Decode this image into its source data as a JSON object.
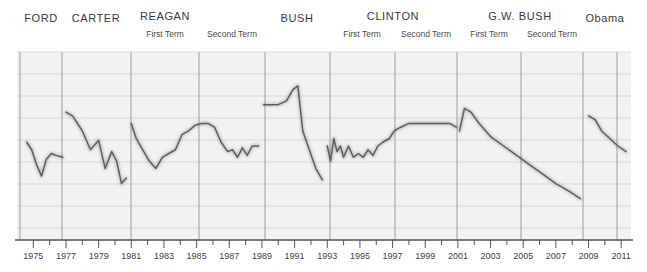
{
  "figure": {
    "background_color": "#ffffff",
    "plot_background_color": "#f2f2f2",
    "gridline_color": "#d8d8d8",
    "divider_color": "#808080",
    "series_color": "#5a5a5a",
    "axis_color": "#555555",
    "plot_left": 17,
    "plot_right": 631,
    "plot_top": 52,
    "plot_bottom": 240
  },
  "presidents": [
    {
      "name": "FORD",
      "terms": [],
      "label_x": 41,
      "start_x": 20,
      "end_x": 62
    },
    {
      "name": "CARTER",
      "terms": [],
      "label_x": 96,
      "start_x": 62,
      "end_x": 131
    },
    {
      "name": "REAGAN",
      "terms": [
        "First Term",
        "Second Term"
      ],
      "label_x": 165,
      "start_x": 131,
      "end_x": 199,
      "term_x": [
        165,
        232
      ],
      "term2_end_x": 265
    },
    {
      "name": "BUSH",
      "terms": [],
      "label_x": 297,
      "start_x": 265,
      "end_x": 330
    },
    {
      "name": "CLINTON",
      "terms": [
        "First Term",
        "Second Term"
      ],
      "label_x": 393,
      "start_x": 330,
      "end_x": 395,
      "term_x": [
        362,
        426
      ],
      "term2_end_x": 457
    },
    {
      "name": "G.W. BUSH",
      "terms": [
        "First Term",
        "Second Term"
      ],
      "label_x": 520,
      "start_x": 457,
      "end_x": 521,
      "term_x": [
        489,
        552
      ],
      "term2_end_x": 583
    },
    {
      "name": "Obama",
      "terms": [],
      "label_x": 605,
      "start_x": 583,
      "end_x": 631
    }
  ],
  "dividers": [
    20,
    62,
    131,
    199,
    265,
    330,
    395,
    457,
    521,
    583,
    617
  ],
  "gridlines_y": [
    52,
    74,
    96,
    118,
    140,
    162,
    184,
    206,
    228,
    240
  ],
  "chart_data": {
    "type": "line",
    "title": "",
    "subtitle": "",
    "xlabel": "",
    "ylabel": "",
    "grid": true,
    "legend": null,
    "xlim": [
      1974.0,
      2011.6
    ],
    "ylim": [
      0,
      100
    ],
    "xticks": [
      1975,
      1976,
      1977,
      1978,
      1979,
      1980,
      1981,
      1982,
      1983,
      1984,
      1985,
      1986,
      1987,
      1988,
      1989,
      1990,
      1991,
      1992,
      1993,
      1994,
      1995,
      1996,
      1997,
      1998,
      1999,
      2000,
      2001,
      2002,
      2003,
      2004,
      2005,
      2006,
      2007,
      2008,
      2009,
      2010,
      2011
    ],
    "xtick_labels": [
      "1975",
      "",
      "1977",
      "",
      "1979",
      "",
      "1981",
      "",
      "1983",
      "",
      "1985",
      "",
      "1987",
      "",
      "1989",
      "",
      "1991",
      "",
      "1993",
      "",
      "1995",
      "",
      "1997",
      "",
      "1999",
      "",
      "2001",
      "",
      "2003",
      "",
      "2005",
      "",
      "2007",
      "",
      "2009",
      "",
      "2011"
    ],
    "series": [
      {
        "name": "Presidential Approval",
        "color": "#5a5a5a",
        "segments": [
          {
            "president": "FORD",
            "x": [
              1974.6,
              1974.9,
              1975.2,
              1975.5,
              1975.8,
              1976.1,
              1976.4,
              1976.8
            ],
            "y": [
              52,
              48,
              40,
              34,
              43,
              46,
              45,
              44
            ]
          },
          {
            "president": "CARTER",
            "x": [
              1977.0,
              1977.4,
              1978.0,
              1978.5,
              1979.0,
              1979.4,
              1979.8,
              1980.1,
              1980.4,
              1980.7
            ],
            "y": [
              68,
              66,
              58,
              48,
              53,
              38,
              47,
              42,
              30,
              33
            ]
          },
          {
            "president": "REAGAN",
            "x": [
              1981.0,
              1981.3,
              1981.7,
              1982.1,
              1982.5,
              1982.9,
              1983.3,
              1983.7,
              1984.1,
              1984.5,
              1984.9,
              1985.3,
              1985.7,
              1986.1,
              1986.5,
              1986.9,
              1987.2,
              1987.5,
              1987.8,
              1988.1,
              1988.4,
              1988.8
            ],
            "y": [
              62,
              54,
              48,
              42,
              38,
              44,
              46,
              48,
              56,
              58,
              61,
              62,
              62,
              60,
              52,
              47,
              48,
              44,
              49,
              45,
              50,
              50
            ]
          },
          {
            "president": "BUSH",
            "x": [
              1989.1,
              1989.5,
              1990.0,
              1990.5,
              1990.9,
              1991.2,
              1991.5,
              1991.9,
              1992.3,
              1992.7
            ],
            "y": [
              72,
              72,
              72,
              74,
              80,
              82,
              58,
              48,
              38,
              32
            ]
          },
          {
            "president": "CLINTON",
            "x": [
              1993.0,
              1993.2,
              1993.4,
              1993.6,
              1993.8,
              1994.0,
              1994.3,
              1994.6,
              1994.9,
              1995.2,
              1995.5,
              1995.8,
              1996.1,
              1996.4,
              1996.8,
              1997.1,
              1997.5,
              1998.0,
              1998.5,
              1999.0,
              1999.5,
              2000.0,
              2000.5,
              2000.9
            ],
            "y": [
              50,
              42,
              54,
              47,
              50,
              44,
              50,
              44,
              46,
              44,
              48,
              45,
              50,
              52,
              54,
              58,
              60,
              62,
              62,
              62,
              62,
              62,
              62,
              60
            ]
          },
          {
            "president": "G.W. BUSH",
            "x": [
              2001.1,
              2001.4,
              2001.8,
              2002.3,
              2003.0,
              2003.8,
              2004.6,
              2005.4,
              2006.2,
              2007.0,
              2007.8,
              2008.5
            ],
            "y": [
              58,
              70,
              68,
              62,
              55,
              50,
              45,
              40,
              35,
              30,
              26,
              22
            ]
          },
          {
            "president": "Obama",
            "x": [
              2009.0,
              2009.4,
              2009.8,
              2010.3,
              2010.8,
              2011.3
            ],
            "y": [
              66,
              64,
              58,
              54,
              50,
              47
            ]
          }
        ]
      }
    ]
  }
}
